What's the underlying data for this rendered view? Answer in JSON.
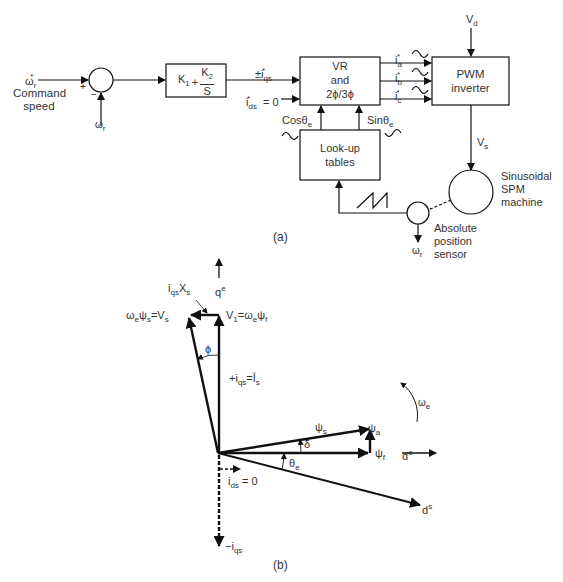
{
  "figure_a": {
    "caption": "(a)",
    "input": {
      "symbol": "ω",
      "sub": "r",
      "sup": "*",
      "label_line1": "Command",
      "label_line2": "speed"
    },
    "summing_junction": {
      "plus": "+",
      "minus": "−",
      "feedback": {
        "symbol": "ω",
        "sub": "r"
      }
    },
    "pi_controller": {
      "k1": "K",
      "k1_sub": "1",
      "plus": "+",
      "num": "K",
      "num_sub": "2",
      "den": "S"
    },
    "iqs_ref": {
      "prefix": "±i",
      "sub": "qs",
      "sup": "*"
    },
    "ids_ref": {
      "prefix": "i",
      "sub": "ds",
      "sup": "*",
      "suffix": " = 0"
    },
    "vr_block": {
      "line1": "VR",
      "line2": "and",
      "line3": "2ϕ/3ϕ"
    },
    "phase_currents": [
      {
        "prefix": "i",
        "sub": "a",
        "sup": "*"
      },
      {
        "prefix": "i",
        "sub": "b",
        "sup": "*"
      },
      {
        "prefix": "i",
        "sub": "c",
        "sup": "*"
      }
    ],
    "pwm_block": {
      "line1": "PWM",
      "line2": "inverter"
    },
    "vd": {
      "prefix": "V",
      "sub": "d"
    },
    "vs": {
      "prefix": "V",
      "sub": "s"
    },
    "cos_label": {
      "prefix": "Cosθ",
      "sub": "e"
    },
    "sin_label": {
      "prefix": "Sinθ",
      "sub": "e"
    },
    "lookup_block": {
      "line1": "Look-up",
      "line2": "tables"
    },
    "machine": {
      "line1": "Sinusoidal",
      "line2": "SPM",
      "line3": "machine"
    },
    "sensor": {
      "line1": "Absolute",
      "line2": "position",
      "line3": "sensor"
    },
    "sensor_output": {
      "symbol": "ω",
      "sub": "r"
    }
  },
  "figure_b": {
    "caption": "(b)",
    "qe_axis": {
      "prefix": "q",
      "sup": "e"
    },
    "de_axis": {
      "prefix": "d",
      "sup": "e"
    },
    "ds_axis": {
      "prefix": "d",
      "sup": "s"
    },
    "iqs_xs": {
      "prefix": "i",
      "sub": "qs",
      "mid": "X",
      "sub2": "s"
    },
    "vs_label": {
      "text1": "ω",
      "sub1": "e",
      "text2": "ψ",
      "sub2": "s",
      "text3": "=V",
      "sub3": "s"
    },
    "v1_label": {
      "text1": "V",
      "sub1": "1",
      "text2": "=ω",
      "sub2": "e",
      "text3": "ψ",
      "sub3": "f"
    },
    "phi": "ϕ",
    "iqs_pos": {
      "prefix": "+i",
      "sub": "qs",
      "mid": "=Î",
      "sub2": "s"
    },
    "omega_e": {
      "symbol": "ω",
      "sub": "e"
    },
    "psi_s": {
      "symbol": "ψ",
      "sub": "s"
    },
    "psi_a": {
      "symbol": "ψ",
      "sub": "a"
    },
    "psi_f": {
      "symbol": "ψ",
      "sub": "f"
    },
    "delta": "δ",
    "theta_e": {
      "symbol": "θ",
      "sub": "e"
    },
    "ids_zero": {
      "prefix": "i",
      "sub": "ds",
      "suffix": " = 0"
    },
    "iqs_neg": {
      "prefix": "−i",
      "sub": "qs"
    }
  },
  "colors": {
    "line": "#111111",
    "text": "#333333",
    "background": "#ffffff"
  }
}
